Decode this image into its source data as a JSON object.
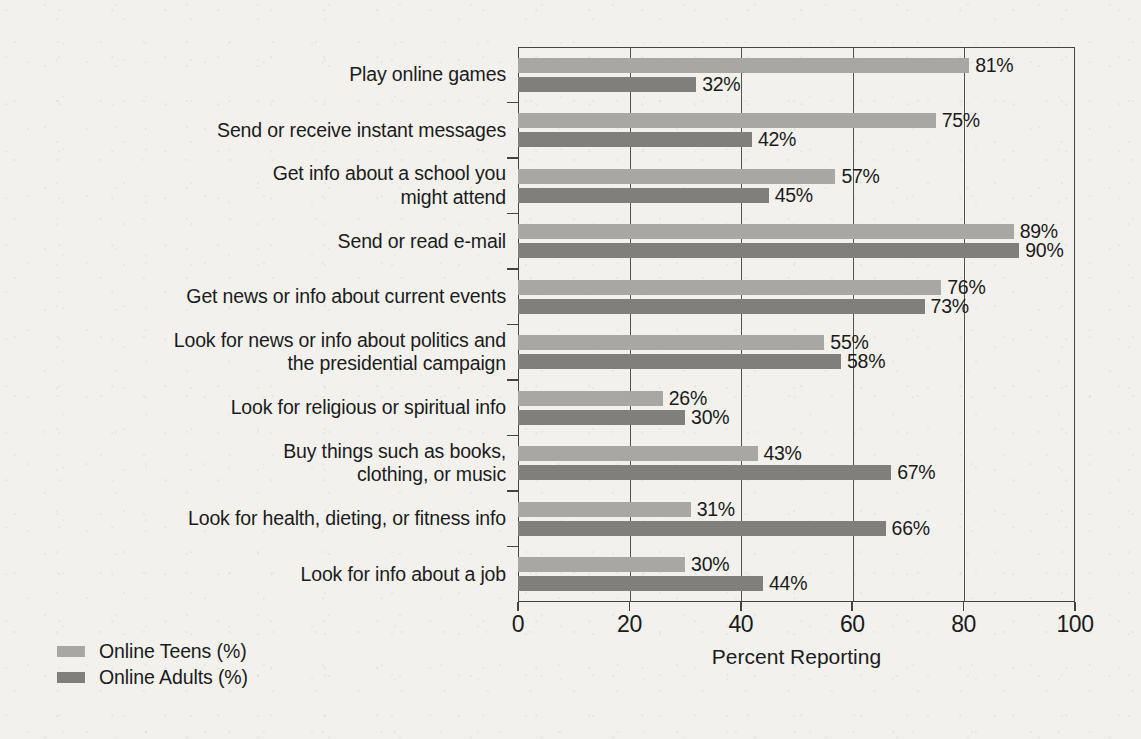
{
  "chart_data": {
    "type": "bar",
    "orientation": "horizontal",
    "title": "",
    "xlabel": "Percent Reporting",
    "ylabel": "",
    "xlim": [
      0,
      100
    ],
    "xticks": [
      0,
      20,
      40,
      60,
      80,
      100
    ],
    "grid": true,
    "legend_position": "bottom-left",
    "categories": [
      "Play online games",
      "Send or receive instant messages",
      "Get info about a school you\nmight attend",
      "Send or read e-mail",
      "Get news or info about current events",
      "Look for news or info about politics and\nthe presidential campaign",
      "Look for religious or spiritual info",
      "Buy things such as books,\nclothing, or music",
      "Look for health, dieting, or fitness info",
      "Look for info about a job"
    ],
    "series": [
      {
        "name": "Online Teens (%)",
        "color": "#a9a7a3",
        "values": [
          81,
          75,
          57,
          89,
          76,
          55,
          26,
          43,
          31,
          30
        ],
        "labels": [
          "81%",
          "75%",
          "57%",
          "89%",
          "76%",
          "55%",
          "26%",
          "43%",
          "31%",
          "30%"
        ]
      },
      {
        "name": "Online Adults (%)",
        "color": "#817f7b",
        "values": [
          32,
          42,
          45,
          90,
          73,
          58,
          30,
          67,
          66,
          44
        ],
        "labels": [
          "32%",
          "42%",
          "45%",
          "90%",
          "73%",
          "58%",
          "30%",
          "67%",
          "66%",
          "44%"
        ]
      }
    ]
  },
  "xtick_labels": [
    "0",
    "20",
    "40",
    "60",
    "80",
    "100"
  ],
  "legend": {
    "items": [
      {
        "label": "Online Teens (%)",
        "color": "#a9a7a3"
      },
      {
        "label": "Online Adults (%)",
        "color": "#817f7b"
      }
    ]
  },
  "axis": {
    "x_title": "Percent Reporting"
  },
  "colors": {
    "background": "#f2f1ed",
    "axis": "#46443f",
    "text": "#1b1b1b",
    "teens_bar": "#a9a7a3",
    "adults_bar": "#817f7b"
  }
}
